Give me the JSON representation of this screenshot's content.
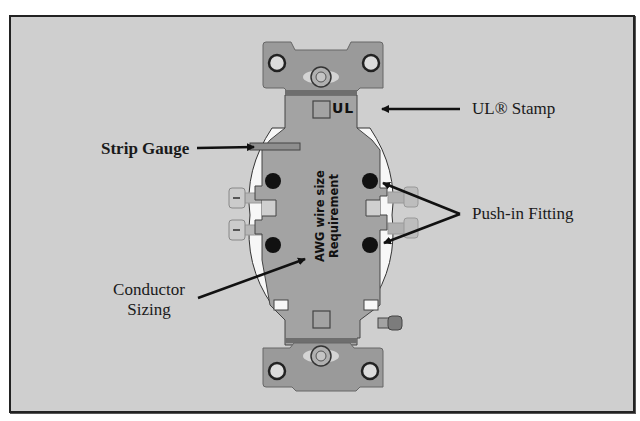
{
  "diagram": {
    "colors": {
      "background": "#cfcfcf",
      "frame_border": "#222222",
      "body": "#a3a3a3",
      "strap": "#9a9a9a",
      "housing_white": "#f7f7f7",
      "terminal_hole": "#111111",
      "arrow": "#111111"
    },
    "body_marks": {
      "ul_mark": "UL",
      "wire_size_line1": "AWG wire size",
      "wire_size_line2": "Requirement"
    },
    "callouts": [
      {
        "id": "ul-stamp",
        "label": "UL® Stamp"
      },
      {
        "id": "strip-gauge",
        "label": "Strip Gauge"
      },
      {
        "id": "push-in-fitting",
        "label": "Push-in Fitting"
      },
      {
        "id": "conductor-sizing",
        "label_line1": "Conductor",
        "label_line2": "Sizing"
      }
    ]
  }
}
